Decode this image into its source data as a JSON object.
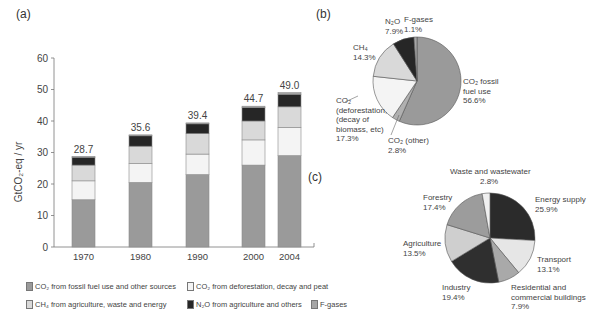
{
  "panels": {
    "a_label": "(a)",
    "b_label": "(b)",
    "c_label": "(c)"
  },
  "colors": {
    "co2_fossil": "#9a9a9a",
    "co2_deforestation": "#f4f4f4",
    "ch4": "#d9d9d9",
    "n2o": "#262626",
    "f_gases": "#a6a6a6",
    "axis": "#777777",
    "text": "#444444"
  },
  "legend": {
    "items": [
      {
        "key": "co2_fossil",
        "label": "CO₂ from fossil fuel use and other sources",
        "color": "#9a9a9a",
        "x": 0,
        "y": 0
      },
      {
        "key": "co2_deforestation",
        "label": "CO₂ from deforestation, decay and peat",
        "color": "#f4f4f4",
        "x": 161,
        "y": 0
      },
      {
        "key": "ch4",
        "label": "CH₄ from agriculture, waste and energy",
        "color": "#d9d9d9",
        "x": 0,
        "y": 18
      },
      {
        "key": "n2o",
        "label": "N₂O from agriculture and others",
        "color": "#262626",
        "x": 161,
        "y": 18
      },
      {
        "key": "f_gases",
        "label": "F-gases",
        "color": "#a6a6a6",
        "x": 285,
        "y": 18
      }
    ]
  },
  "chart_data": [
    {
      "id": "a",
      "type": "bar",
      "stacked": true,
      "title": "",
      "xlabel": "",
      "ylabel": "GtCO₂-eq / yr",
      "ylim": [
        0,
        60
      ],
      "yticks": [
        0,
        10,
        20,
        30,
        40,
        50,
        60
      ],
      "grid": false,
      "categories": [
        "1970",
        "1980",
        "1990",
        "2000",
        "2004"
      ],
      "totals": [
        28.7,
        35.6,
        39.4,
        44.7,
        49.0
      ],
      "total_labels": [
        "28.7",
        "35.6",
        "39.4",
        "44.7",
        "49.0"
      ],
      "series": [
        {
          "name": "CO₂ from fossil fuel use and other sources",
          "color": "#9a9a9a",
          "values": [
            15.0,
            20.5,
            23.0,
            26.0,
            29.0
          ]
        },
        {
          "name": "CO₂ from deforestation, decay and peat",
          "color": "#f4f4f4",
          "values": [
            6.0,
            6.0,
            6.5,
            8.0,
            9.0
          ]
        },
        {
          "name": "CH₄ from agriculture, waste and energy",
          "color": "#d9d9d9",
          "values": [
            5.0,
            5.5,
            6.5,
            6.0,
            6.5
          ]
        },
        {
          "name": "N₂O from agriculture and others",
          "color": "#262626",
          "values": [
            2.5,
            3.3,
            3.1,
            4.3,
            4.0
          ]
        },
        {
          "name": "F-gases",
          "color": "#a6a6a6",
          "values": [
            0.2,
            0.3,
            0.3,
            0.4,
            0.5
          ]
        }
      ],
      "legend_position": "bottom"
    },
    {
      "id": "b",
      "type": "pie",
      "title": "",
      "slices": [
        {
          "label": "CO₂ fossil fuel use",
          "value": 56.6,
          "display": "56.6%",
          "color": "#9a9a9a"
        },
        {
          "label": "CO₂ (other)",
          "value": 2.8,
          "display": "2.8%",
          "color": "#b0b0b0"
        },
        {
          "label": "CO₂ (deforestation, decay of biomass, etc)",
          "value": 17.3,
          "display": "17.3%",
          "color": "#f4f4f4"
        },
        {
          "label": "CH₄",
          "value": 14.3,
          "display": "14.3%",
          "color": "#d9d9d9"
        },
        {
          "label": "N₂O",
          "value": 7.9,
          "display": "7.9%",
          "color": "#262626"
        },
        {
          "label": "F-gases",
          "value": 1.1,
          "display": "1.1%",
          "color": "#a6a6a6"
        }
      ]
    },
    {
      "id": "c",
      "type": "pie",
      "title": "",
      "slices": [
        {
          "label": "Energy supply",
          "value": 25.9,
          "display": "25.9%",
          "color": "#2b2b2b"
        },
        {
          "label": "Transport",
          "value": 13.1,
          "display": "13.1%",
          "color": "#e6e6e6"
        },
        {
          "label": "Residential and commercial buildings",
          "value": 7.9,
          "display": "7.9%",
          "color": "#a9a9a9"
        },
        {
          "label": "Industry",
          "value": 19.4,
          "display": "19.4%",
          "color": "#2f2f2f"
        },
        {
          "label": "Agriculture",
          "value": 13.5,
          "display": "13.5%",
          "color": "#cfcfcf"
        },
        {
          "label": "Forestry",
          "value": 17.4,
          "display": "17.4%",
          "color": "#9c9c9c"
        },
        {
          "label": "Waste and wastewater",
          "value": 2.8,
          "display": "2.8%",
          "color": "#f0f0f0"
        }
      ]
    }
  ]
}
